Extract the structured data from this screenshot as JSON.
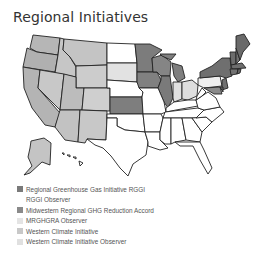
{
  "title": "Regional Initiatives",
  "colors": {
    "rggi": "#6e6e6e",
    "rggi_observer": "#ffffff",
    "mwgghg": "#7d7d7d",
    "mrghgra_observer": "#e2e2e2",
    "wci": "#b4b4b4",
    "wci_observer": "#d9d9d9",
    "none": "#ffffff"
  },
  "legend": [
    {
      "label": "Regional Greenhouse Gas Initiative RGGI",
      "color": "#7a7a7a"
    },
    {
      "label": "RGGI Observer",
      "color": "#ffffff"
    },
    {
      "label": "Midwestern Regional GHG Reduction Accord",
      "color": "#8a8a8a"
    },
    {
      "label": "MRGHGRA Observer",
      "color": "#e4e4e4"
    },
    {
      "label": "Western Climate Initiative",
      "color": "#c8c8c8"
    },
    {
      "label": "Western Climate Initiative Observer",
      "color": "#e0e0e0"
    }
  ]
}
